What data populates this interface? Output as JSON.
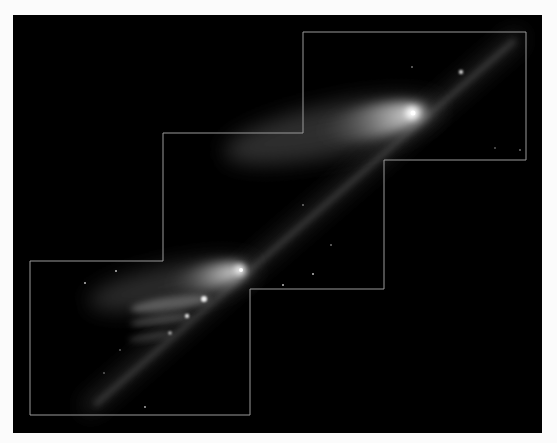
{
  "image": {
    "description": "Astronomical image of a fragmented comet train across a stair-step mosaic of detector frames",
    "subject": "comet fragment chain",
    "colors": {
      "page_background": "#fbfbfb",
      "sky": "#000000",
      "mosaic_outline": "#9a9a9a",
      "coma": "#ffffff"
    },
    "mosaic_frames": [
      "upper-right frame",
      "middle frame",
      "lower-left frame"
    ],
    "fragments": [
      {
        "id": "main-nucleus-upper",
        "brightness": "high"
      },
      {
        "id": "main-nucleus-lower",
        "brightness": "high"
      },
      {
        "id": "fragment-2",
        "brightness": "medium"
      },
      {
        "id": "fragment-3",
        "brightness": "low"
      },
      {
        "id": "fragment-4",
        "brightness": "low"
      },
      {
        "id": "fragment-upper-small",
        "brightness": "low"
      }
    ]
  }
}
